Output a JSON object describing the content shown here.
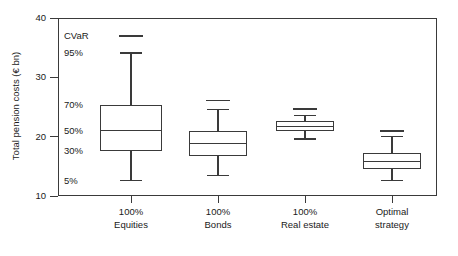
{
  "chart_data": {
    "type": "box",
    "title": "",
    "xlabel": "",
    "ylabel": "Total pension costs (€ bn)",
    "ylim": [
      10,
      40
    ],
    "yticks": [
      10,
      20,
      30,
      40
    ],
    "ytick_labels": [
      "10",
      "20",
      "30",
      "40"
    ],
    "grid": false,
    "legend": false,
    "percentile_annotations": [
      {
        "label": "CVaR",
        "value": 37.0
      },
      {
        "label": "95%",
        "value": 34.1
      },
      {
        "label": "70%",
        "value": 25.3
      },
      {
        "label": "50%",
        "value": 21.0
      },
      {
        "label": "30%",
        "value": 17.6
      },
      {
        "label": "5%",
        "value": 12.6
      }
    ],
    "categories": [
      {
        "line1": "100%",
        "line2": "Equities"
      },
      {
        "line1": "100%",
        "line2": "Bonds"
      },
      {
        "line1": "100%",
        "line2": "Real estate"
      },
      {
        "line1": "Optimal",
        "line2": "strategy"
      }
    ],
    "boxes": [
      {
        "name": "100% Equities",
        "cvar": 37.0,
        "p95": 34.1,
        "p70": 25.3,
        "p50": 21.0,
        "p30": 17.6,
        "p5": 12.6
      },
      {
        "name": "100% Bonds",
        "cvar": 26.1,
        "p95": 24.6,
        "p70": 21.0,
        "p50": 18.8,
        "p30": 16.7,
        "p5": 13.5
      },
      {
        "name": "100% Real estate",
        "cvar": 24.6,
        "p95": 23.6,
        "p70": 22.6,
        "p50": 21.7,
        "p30": 20.9,
        "p5": 19.6
      },
      {
        "name": "Optimal strategy",
        "cvar": 21.0,
        "p95": 20.0,
        "p70": 17.2,
        "p50": 15.8,
        "p30": 14.6,
        "p5": 12.6
      }
    ]
  },
  "colors": {
    "line": "#3a3a3a",
    "text": "#1a1a1a",
    "background": "#ffffff"
  }
}
